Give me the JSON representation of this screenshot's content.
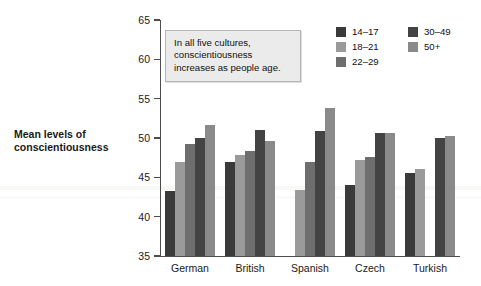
{
  "chart_data": {
    "type": "bar",
    "title": "",
    "subtitle": "",
    "xlabel": "",
    "ylabel": "Mean levels of conscientiousness",
    "ylabel_lines": [
      "Mean levels of",
      "conscientiousness"
    ],
    "ylim": [
      35,
      65
    ],
    "ytick_values": [
      35,
      40,
      45,
      50,
      55,
      60,
      65
    ],
    "ytick_labels": [
      "35",
      "40",
      "45",
      "50",
      "55",
      "60",
      "65"
    ],
    "grid": false,
    "legend_position": "top-right",
    "categories": [
      "German",
      "British",
      "Spanish",
      "Czech",
      "Turkish"
    ],
    "series": [
      {
        "name": "14–17",
        "color": "#3a3a3a",
        "values": [
          43.3,
          47.0,
          null,
          44.0,
          45.6
        ]
      },
      {
        "name": "18–21",
        "color": "#9a9a9a",
        "values": [
          46.9,
          47.8,
          43.4,
          47.2,
          46.0
        ]
      },
      {
        "name": "22–29",
        "color": "#6e6e6e",
        "values": [
          49.3,
          48.4,
          47.0,
          47.6,
          null
        ]
      },
      {
        "name": "30–49",
        "color": "#434343",
        "values": [
          50.0,
          51.0,
          50.9,
          50.7,
          50.0
        ]
      },
      {
        "name": "50+",
        "color": "#8a8a8a",
        "values": [
          51.6,
          49.6,
          53.8,
          50.7,
          50.2
        ]
      }
    ],
    "annotation": {
      "text": "In all five cultures, conscientiousness increases as people age.",
      "lines": [
        "In all five cultures,",
        "conscientiousness",
        "increases as people age."
      ]
    }
  },
  "legend": {
    "entries": [
      {
        "label": "14–17",
        "color": "#3a3a3a"
      },
      {
        "label": "18–21",
        "color": "#9a9a9a"
      },
      {
        "label": "22–29",
        "color": "#6e6e6e"
      },
      {
        "label": "30–49",
        "color": "#434343"
      },
      {
        "label": "50+",
        "color": "#8a8a8a"
      }
    ]
  },
  "colors": {
    "axis": "#4d4d4d",
    "text": "#1a1a1a",
    "background": "#ffffff",
    "annotation_bg": "#ebebeb",
    "annotation_border": "#b4b4b4"
  }
}
